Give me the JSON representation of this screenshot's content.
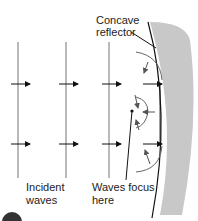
{
  "diagram": {
    "labels": {
      "reflector_line1": "Concave",
      "reflector_line2": "reflector",
      "incident_line1": "Incident",
      "incident_line2": "waves",
      "focus_line1": "Waves focus",
      "focus_line2": "here"
    },
    "colors": {
      "reflector_fill": "#c8c8c8",
      "wave_line": "#8a8a8a",
      "arrow": "#111111",
      "text": "#222222",
      "badge": "#333333"
    }
  }
}
